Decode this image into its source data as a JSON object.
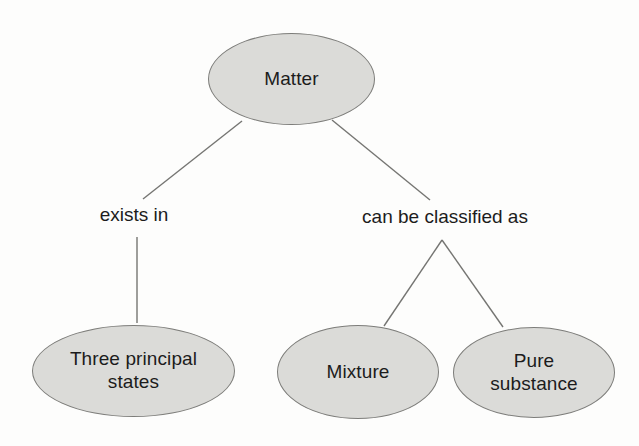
{
  "diagram": {
    "type": "concept-map",
    "nodes": {
      "matter": {
        "label": "Matter"
      },
      "three_principal_states": {
        "label": "Three principal\nstates"
      },
      "mixture": {
        "label": "Mixture"
      },
      "pure_substance": {
        "label": "Pure\nsubstance"
      }
    },
    "edge_labels": {
      "exists_in": "exists in",
      "can_be_classified_as": "can be classified as"
    },
    "edges": [
      {
        "from": "Matter",
        "label": "exists in",
        "to": "Three principal states"
      },
      {
        "from": "Matter",
        "label": "can be classified as",
        "to": "Mixture"
      },
      {
        "from": "Matter",
        "label": "can be classified as",
        "to": "Pure substance"
      }
    ],
    "colors": {
      "node_fill": "#dbdbd8",
      "node_border": "#7d7d7a",
      "edge_line": "#757572",
      "text": "#1c1c1c",
      "background": "#fdfdfc"
    }
  }
}
